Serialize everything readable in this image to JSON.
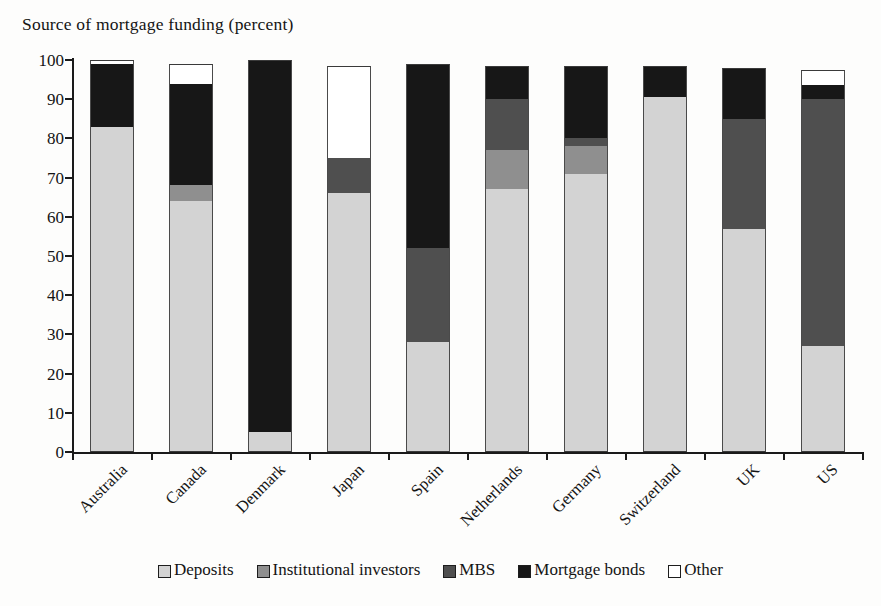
{
  "chart_data": {
    "type": "bar",
    "subtype": "stacked-bar-100",
    "title": "Source of mortgage funding (percent)",
    "xlabel": "",
    "ylabel": "",
    "ylim": [
      0,
      100
    ],
    "yticks": [
      0,
      10,
      20,
      30,
      40,
      50,
      60,
      70,
      80,
      90,
      100
    ],
    "grid": false,
    "legend_position": "bottom",
    "categories": [
      "Australia",
      "Canada",
      "Denmark",
      "Japan",
      "Spain",
      "Netherlands",
      "Germany",
      "Switzerland",
      "UK",
      "US"
    ],
    "series": [
      {
        "name": "Deposits",
        "color": "#d3d3d3",
        "values": [
          83,
          64,
          5,
          66,
          28,
          67,
          71,
          90.5,
          57,
          27
        ]
      },
      {
        "name": "Institutional investors",
        "color": "#8f8f8f",
        "values": [
          0,
          4,
          0,
          0,
          0,
          10,
          7,
          0,
          0,
          0
        ]
      },
      {
        "name": "MBS",
        "color": "#4f4f4f",
        "values": [
          0,
          0,
          0,
          9,
          24,
          13,
          2,
          0,
          28,
          63
        ]
      },
      {
        "name": "Mortgage bonds",
        "color": "#171717",
        "values": [
          16,
          26,
          95,
          0,
          47,
          8.5,
          18.5,
          8,
          13,
          3.5
        ]
      },
      {
        "name": "Other",
        "color": "#ffffff",
        "values": [
          1,
          5,
          0,
          23.5,
          0,
          0,
          0,
          0,
          0,
          4
        ]
      }
    ],
    "legend": [
      "Deposits",
      "Institutional investors",
      "MBS",
      "Mortgage bonds",
      "Other"
    ]
  }
}
